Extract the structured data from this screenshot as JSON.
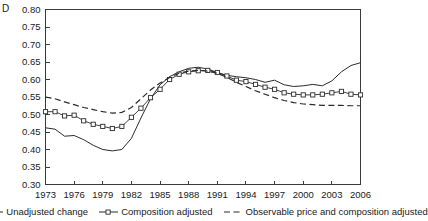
{
  "panel": {
    "label": "D"
  },
  "legend": {
    "position": "bottom-center",
    "entries": [
      {
        "label": "Unadjusted change",
        "style": "solid",
        "marker": "none"
      },
      {
        "label": "Composition adjusted",
        "style": "solid",
        "marker": "square"
      },
      {
        "label": "Observable price and composition adjusted",
        "style": "dashed",
        "marker": "none"
      }
    ]
  },
  "chart_data": {
    "type": "line",
    "title": "D",
    "xlabel": "",
    "ylabel": "",
    "xlim": [
      1973,
      2006
    ],
    "ylim": [
      0.3,
      0.8
    ],
    "grid": false,
    "legend_position": "bottom",
    "yticks": [
      "0.30",
      "0.35",
      "0.40",
      "0.45",
      "0.50",
      "0.55",
      "0.60",
      "0.65",
      "0.70",
      "0.75",
      "0.80"
    ],
    "ytick_values": [
      0.3,
      0.35,
      0.4,
      0.45,
      0.5,
      0.55,
      0.6,
      0.65,
      0.7,
      0.75,
      0.8
    ],
    "xticks": [
      "1973",
      "1976",
      "1979",
      "1982",
      "1985",
      "1988",
      "1991",
      "1994",
      "1997",
      "2000",
      "2003",
      "2006"
    ],
    "xtick_values": [
      1973,
      1976,
      1979,
      1982,
      1985,
      1988,
      1991,
      1994,
      1997,
      2000,
      2003,
      2006
    ],
    "x": [
      1973,
      1974,
      1975,
      1976,
      1977,
      1978,
      1979,
      1980,
      1981,
      1982,
      1983,
      1984,
      1985,
      1986,
      1987,
      1988,
      1989,
      1990,
      1991,
      1992,
      1993,
      1994,
      1995,
      1996,
      1997,
      1998,
      1999,
      2000,
      2001,
      2002,
      2003,
      2004,
      2005,
      2006
    ],
    "series": [
      {
        "name": "Unadjusted change",
        "style": "solid",
        "marker": "none",
        "values": [
          0.462,
          0.458,
          0.438,
          0.44,
          0.428,
          0.412,
          0.4,
          0.396,
          0.4,
          0.432,
          0.49,
          0.545,
          0.585,
          0.608,
          0.622,
          0.632,
          0.635,
          0.63,
          0.62,
          0.612,
          0.608,
          0.605,
          0.6,
          0.592,
          0.598,
          0.585,
          0.58,
          0.582,
          0.586,
          0.582,
          0.596,
          0.622,
          0.64,
          0.648
        ]
      },
      {
        "name": "Composition adjusted",
        "style": "solid",
        "marker": "square",
        "values": [
          0.508,
          0.508,
          0.496,
          0.498,
          0.482,
          0.472,
          0.466,
          0.46,
          0.466,
          0.492,
          0.518,
          0.548,
          0.572,
          0.6,
          0.615,
          0.622,
          0.625,
          0.626,
          0.62,
          0.61,
          0.598,
          0.594,
          0.586,
          0.578,
          0.572,
          0.562,
          0.558,
          0.556,
          0.556,
          0.558,
          0.562,
          0.566,
          0.558,
          0.556
        ]
      },
      {
        "name": "Observable price and composition adjusted",
        "style": "dashed",
        "marker": "none",
        "values": [
          0.55,
          0.545,
          0.536,
          0.528,
          0.52,
          0.514,
          0.508,
          0.504,
          0.506,
          0.52,
          0.545,
          0.57,
          0.59,
          0.606,
          0.618,
          0.624,
          0.626,
          0.624,
          0.618,
          0.606,
          0.592,
          0.58,
          0.568,
          0.558,
          0.548,
          0.54,
          0.534,
          0.53,
          0.528,
          0.526,
          0.526,
          0.526,
          0.525,
          0.525
        ]
      }
    ]
  }
}
